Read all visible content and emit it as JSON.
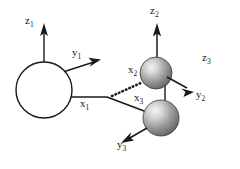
{
  "figure": {
    "type": "coordinate-frames-diagram",
    "background_color": "#ffffff",
    "stroke_color": "#1a1a1a",
    "width": 240,
    "height": 169
  },
  "bodies": [
    {
      "id": "body-1",
      "shape": "open-circle",
      "fill": "#ffffff",
      "stroke": "#1a1a1a",
      "cx": 44,
      "cy": 90,
      "r": 28
    },
    {
      "id": "body-2",
      "shape": "shaded-sphere",
      "fill": "#8c8c8c",
      "highlight": "#e8e8e8",
      "cx": 156,
      "cy": 73,
      "r": 16
    },
    {
      "id": "body-3",
      "shape": "shaded-sphere",
      "fill": "#8c8c8c",
      "highlight": "#e8e8e8",
      "cx": 161,
      "cy": 118,
      "r": 18
    }
  ],
  "frames": [
    {
      "name": "frame-1",
      "axes": [
        {
          "name": "z1",
          "label": "z",
          "subscript": "1",
          "style": "solid-arrow",
          "direction": "up"
        },
        {
          "name": "y1",
          "label": "y",
          "subscript": "1",
          "style": "solid-arrow",
          "direction": "up-right"
        },
        {
          "name": "x1",
          "label": "x",
          "subscript": "1",
          "style": "solid-line",
          "direction": "right"
        }
      ]
    },
    {
      "name": "frame-2",
      "axes": [
        {
          "name": "z2",
          "label": "z",
          "subscript": "2",
          "style": "solid-arrow",
          "direction": "up"
        },
        {
          "name": "y2",
          "label": "y",
          "subscript": "2",
          "style": "solid-arrow",
          "direction": "down-right"
        },
        {
          "name": "x2",
          "label": "x",
          "subscript": "2",
          "style": "dotted-arrow",
          "direction": "up-left"
        }
      ]
    },
    {
      "name": "frame-3",
      "axes": [
        {
          "name": "z3",
          "label": "z",
          "subscript": "3",
          "style": "text-only",
          "direction": "none"
        },
        {
          "name": "y3",
          "label": "y",
          "subscript": "3",
          "style": "solid-arrow",
          "direction": "down-left"
        },
        {
          "name": "x3",
          "label": "x",
          "subscript": "3",
          "style": "solid-line",
          "direction": "up-left"
        }
      ]
    }
  ],
  "labels": {
    "z1": {
      "text": "z",
      "sub": "1"
    },
    "y1": {
      "text": "y",
      "sub": "1"
    },
    "x1": {
      "text": "x",
      "sub": "1"
    },
    "z2": {
      "text": "z",
      "sub": "2"
    },
    "y2": {
      "text": "y",
      "sub": "2"
    },
    "x2": {
      "text": "x",
      "sub": "2"
    },
    "z3": {
      "text": "z",
      "sub": "3"
    },
    "y3": {
      "text": "y",
      "sub": "3"
    },
    "x3": {
      "text": "x",
      "sub": "3"
    }
  }
}
